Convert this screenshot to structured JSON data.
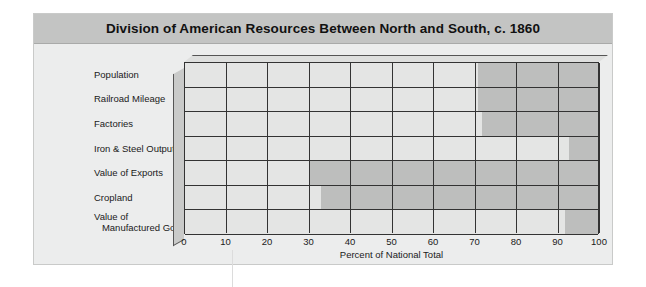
{
  "figure": {
    "title": "Division of American Resources Between North and South, c. 1860"
  },
  "chart_data": {
    "type": "bar",
    "orientation": "horizontal",
    "stacked": true,
    "normalized_percent": true,
    "title": "Division of American Resources Between North and South, c. 1860",
    "xlabel": "Percent of National Total",
    "ylabel": "",
    "xlim": [
      0,
      100
    ],
    "xticks": [
      0,
      10,
      20,
      30,
      40,
      50,
      60,
      70,
      80,
      90,
      100
    ],
    "xticklabels": [
      "0",
      "10",
      "20",
      "30",
      "40",
      "50",
      "60",
      "70",
      "80",
      "90",
      "100"
    ],
    "grid": true,
    "legend": null,
    "categories": [
      "Population",
      "Railroad Mileage",
      "Factories",
      "Iron & Steel Output",
      "Value of Exports",
      "Cropland",
      "Value of\n   Manufactured Goods"
    ],
    "series": [
      {
        "name": "North",
        "color": "#e4e5e4",
        "values": [
          71,
          71,
          72,
          93,
          30,
          33,
          92
        ]
      },
      {
        "name": "South",
        "color": "#bdbebd",
        "values": [
          29,
          29,
          28,
          7,
          70,
          67,
          8
        ]
      }
    ],
    "colors": {
      "north_fill": "#e4e5e4",
      "south_fill": "#bdbebd",
      "gridline": "#333333",
      "plot_background": "#e2e3e2",
      "panel_background": "#eceded",
      "title_bar": "#c3c4c3",
      "depth_side": "#c9cac9",
      "depth_top": "#dedfde"
    }
  }
}
